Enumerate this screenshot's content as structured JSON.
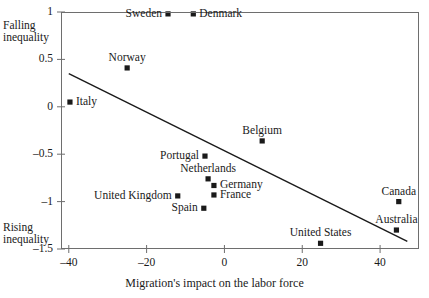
{
  "chart_data": {
    "type": "scatter",
    "title": "",
    "xlabel": "Migration's impact on the labor force",
    "ylabel": "",
    "xlim": [
      -42,
      50
    ],
    "ylim": [
      -1.5,
      1
    ],
    "grid": false,
    "legend": null,
    "xticks": [
      -40,
      -20,
      0,
      20,
      40
    ],
    "xtick_labels": [
      "–40",
      "–20",
      "0",
      "20",
      "40"
    ],
    "yticks": [
      -1.5,
      -1,
      -0.5,
      0,
      0.5,
      1
    ],
    "ytick_labels": [
      "–1.5",
      "–1",
      "–0.5",
      "0",
      "0.5",
      "1"
    ],
    "annotations": [
      {
        "text": "Falling",
        "x": -41.5,
        "y": 0.86,
        "name": "falling-inequality-note-line1"
      },
      {
        "text": "inequality",
        "x": -41.5,
        "y": 0.74,
        "name": "falling-inequality-note-line2"
      },
      {
        "text": "Rising",
        "x": -41.5,
        "y": -1.27,
        "name": "rising-inequality-note-line1"
      },
      {
        "text": "inequality",
        "x": -41.5,
        "y": -1.39,
        "name": "rising-inequality-note-line2"
      }
    ],
    "trendline": {
      "x": [
        -40.0,
        47.0
      ],
      "y": [
        0.35,
        -1.42
      ]
    },
    "points": [
      {
        "name": "Sweden",
        "x": -14.5,
        "y": 0.98,
        "label_pos": "left"
      },
      {
        "name": "Denmark",
        "x": -8.0,
        "y": 0.98,
        "label_pos": "right"
      },
      {
        "name": "Norway",
        "x": -25.0,
        "y": 0.41,
        "label_pos": "above"
      },
      {
        "name": "Italy",
        "x": -39.7,
        "y": 0.05,
        "label_pos": "right"
      },
      {
        "name": "Belgium",
        "x": 9.7,
        "y": -0.36,
        "label_pos": "above"
      },
      {
        "name": "Portugal",
        "x": -5.0,
        "y": -0.52,
        "label_pos": "left"
      },
      {
        "name": "Netherlands",
        "x": -4.2,
        "y": -0.76,
        "label_pos": "above"
      },
      {
        "name": "Germany",
        "x": -2.7,
        "y": -0.83,
        "label_pos": "right"
      },
      {
        "name": "France",
        "x": -2.7,
        "y": -0.93,
        "label_pos": "right"
      },
      {
        "name": "United Kingdom",
        "x": -12.0,
        "y": -0.94,
        "label_pos": "left"
      },
      {
        "name": "Spain",
        "x": -5.3,
        "y": -1.07,
        "label_pos": "left"
      },
      {
        "name": "Canada",
        "x": 44.8,
        "y": -1.0,
        "label_pos": "above"
      },
      {
        "name": "Australia",
        "x": 44.2,
        "y": -1.3,
        "label_pos": "above"
      },
      {
        "name": "United States",
        "x": 24.7,
        "y": -1.44,
        "label_pos": "above"
      }
    ]
  }
}
